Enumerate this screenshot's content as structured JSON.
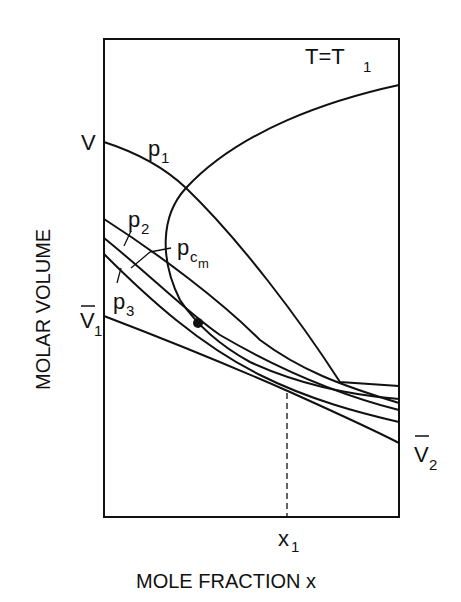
{
  "diagram": {
    "title": "T=T",
    "title_sub": "1",
    "y_axis_label": "MOLAR VOLUME",
    "x_axis_label": "MOLE FRACTION x",
    "left_labels": {
      "V": "V",
      "V1_main": "V",
      "V1_sub": "1"
    },
    "right_labels": {
      "V2_main": "V",
      "V2_sub": "2"
    },
    "x_marker": {
      "main": "x",
      "sub": "1"
    },
    "isobars": [
      {
        "id": "p1",
        "main": "p",
        "sub": "1"
      },
      {
        "id": "p2",
        "main": "p",
        "sub": "2"
      },
      {
        "id": "pcm",
        "main": "p",
        "sub": "c",
        "subsub": "m"
      },
      {
        "id": "p3",
        "main": "p",
        "sub": "3"
      }
    ],
    "features": [
      "two-phase envelope",
      "critical point",
      "x1 dashed marker"
    ]
  }
}
